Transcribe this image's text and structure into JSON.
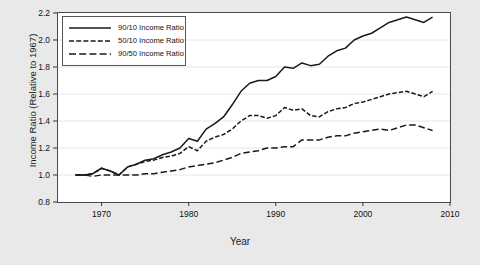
{
  "chart_data": {
    "type": "line",
    "title": "",
    "xlabel": "Year",
    "ylabel": "Income Ratio (Relative to 1967)",
    "xlim": [
      1965,
      2010
    ],
    "ylim": [
      0.8,
      2.2
    ],
    "xticks": [
      1970,
      1980,
      1990,
      2000,
      2010
    ],
    "yticks": [
      0.8,
      1.0,
      1.2,
      1.4,
      1.6,
      1.8,
      2.0,
      2.2
    ],
    "grid": true,
    "legend_position": "top-left",
    "x": [
      1967,
      1968,
      1969,
      1970,
      1971,
      1972,
      1973,
      1974,
      1975,
      1976,
      1977,
      1978,
      1979,
      1980,
      1981,
      1982,
      1983,
      1984,
      1985,
      1986,
      1987,
      1988,
      1989,
      1990,
      1991,
      1992,
      1993,
      1994,
      1995,
      1996,
      1997,
      1998,
      1999,
      2000,
      2001,
      2002,
      2003,
      2004,
      2005,
      2006,
      2007,
      2008
    ],
    "series": [
      {
        "name": "90/10 Income Ratio",
        "style": "solid",
        "values": [
          1.0,
          1.0,
          1.01,
          1.05,
          1.03,
          1.0,
          1.06,
          1.08,
          1.11,
          1.12,
          1.15,
          1.17,
          1.2,
          1.27,
          1.25,
          1.34,
          1.38,
          1.43,
          1.52,
          1.62,
          1.68,
          1.7,
          1.7,
          1.73,
          1.8,
          1.79,
          1.83,
          1.81,
          1.82,
          1.88,
          1.92,
          1.94,
          2.0,
          2.03,
          2.05,
          2.09,
          2.13,
          2.15,
          2.17,
          2.15,
          2.13,
          2.17
        ]
      },
      {
        "name": "50/10 Income Ratio",
        "style": "dotted-dash",
        "values": [
          1.0,
          1.0,
          1.01,
          1.05,
          1.03,
          1.0,
          1.06,
          1.08,
          1.1,
          1.11,
          1.13,
          1.14,
          1.16,
          1.21,
          1.18,
          1.25,
          1.28,
          1.3,
          1.34,
          1.4,
          1.44,
          1.44,
          1.42,
          1.44,
          1.5,
          1.48,
          1.49,
          1.44,
          1.43,
          1.47,
          1.49,
          1.5,
          1.53,
          1.54,
          1.56,
          1.58,
          1.6,
          1.61,
          1.62,
          1.6,
          1.58,
          1.62
        ]
      },
      {
        "name": "90/50 Income Ratio",
        "style": "dashed",
        "values": [
          1.0,
          1.0,
          0.99,
          1.0,
          1.0,
          1.0,
          1.0,
          1.0,
          1.01,
          1.01,
          1.02,
          1.03,
          1.04,
          1.06,
          1.07,
          1.08,
          1.09,
          1.11,
          1.13,
          1.16,
          1.17,
          1.18,
          1.2,
          1.2,
          1.21,
          1.21,
          1.26,
          1.26,
          1.26,
          1.28,
          1.29,
          1.29,
          1.31,
          1.32,
          1.33,
          1.34,
          1.33,
          1.35,
          1.37,
          1.37,
          1.35,
          1.33
        ]
      }
    ]
  },
  "legend": {
    "items": [
      {
        "label": "90/10 Income Ratio"
      },
      {
        "label": "50/10 Income Ratio"
      },
      {
        "label": "90/50 Income Ratio"
      }
    ]
  },
  "axes": {
    "x_tick_labels": [
      "1970",
      "1980",
      "1990",
      "2000",
      "2010"
    ],
    "y_tick_labels": [
      "0.8",
      "1.0",
      "1.2",
      "1.4",
      "1.6",
      "1.8",
      "2.0",
      "2.2"
    ],
    "x_title": "Year",
    "y_title": "Income Ratio (Relative to 1967)"
  },
  "colors": {
    "line": "#1a1a1a",
    "grid": "#e6e6e6",
    "frame": "#4a4a4a",
    "plot_bg": "#ffffff",
    "page_bg": "#e9e9e9"
  }
}
